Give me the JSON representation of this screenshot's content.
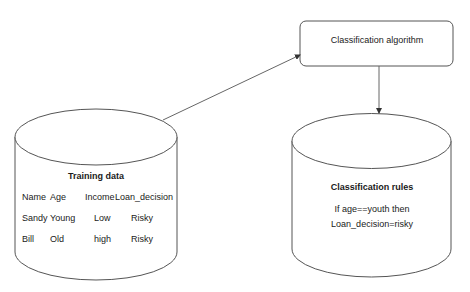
{
  "algorithm_box": {
    "label": "Classification algorithm"
  },
  "training_data": {
    "title": "Training data",
    "columns": [
      "Name",
      "Age",
      "Income",
      "Loan_decision"
    ],
    "rows": [
      [
        "Sandy",
        "Young",
        "Low",
        "Risky"
      ],
      [
        "Bill",
        "Old",
        "high",
        "Risky"
      ]
    ]
  },
  "classification_rules": {
    "title": "Classification rules",
    "line1": "If age==youth then",
    "line2": "Loan_decision=risky"
  },
  "colors": {
    "stroke": "#555555",
    "background": "#ffffff",
    "text": "#1a1a1a"
  }
}
